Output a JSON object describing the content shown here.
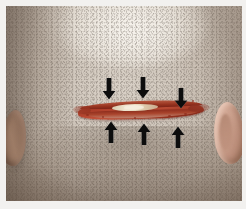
{
  "image": {
    "type": "clinical-photograph",
    "subject": "posterior scalp of shaved head",
    "view": "occipital / back of head",
    "background_color": "#ffffff",
    "skin_color": "#d2c9be",
    "wound": {
      "name": "scalp-laceration",
      "description": "horizontal linear laceration of the occipital scalp with gaping edges",
      "edge_color": "#9a3522",
      "center_color": "#efe5cf",
      "orientation": "horizontal"
    },
    "annotations": {
      "marker_color": "#101010",
      "count": 6,
      "meaning": "direction of wound edge approximation",
      "arrows": [
        {
          "name": "arrow-down-left",
          "direction": "down",
          "position": "above-wound-left"
        },
        {
          "name": "arrow-down-center",
          "direction": "down",
          "position": "above-wound-center"
        },
        {
          "name": "arrow-down-right",
          "direction": "down",
          "position": "above-wound-right"
        },
        {
          "name": "arrow-up-left",
          "direction": "up",
          "position": "below-wound-left"
        },
        {
          "name": "arrow-up-center",
          "direction": "up",
          "position": "below-wound-center"
        },
        {
          "name": "arrow-up-right",
          "direction": "up",
          "position": "below-wound-right"
        }
      ]
    },
    "anatomy": [
      {
        "name": "ear-left",
        "label": "left ear"
      },
      {
        "name": "ear-right",
        "label": "right ear"
      },
      {
        "name": "scalp",
        "label": "shaved scalp with stubble"
      }
    ]
  }
}
